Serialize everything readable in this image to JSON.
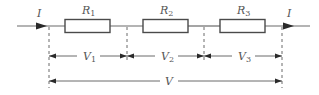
{
  "diagram": {
    "current_label": "I",
    "resistors": [
      {
        "name": "R",
        "sub": "1"
      },
      {
        "name": "R",
        "sub": "2"
      },
      {
        "name": "R",
        "sub": "3"
      }
    ],
    "voltages": [
      {
        "name": "V",
        "sub": "1"
      },
      {
        "name": "V",
        "sub": "2"
      },
      {
        "name": "V",
        "sub": "3"
      }
    ],
    "total_voltage": {
      "name": "V"
    },
    "colors": {
      "line": "#6a6a6a",
      "arrow": "#2a2a2a",
      "text": "#555555"
    }
  }
}
